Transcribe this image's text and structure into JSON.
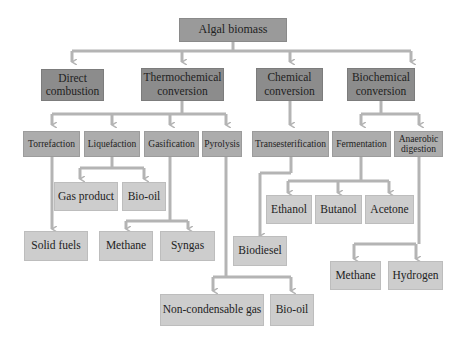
{
  "diagram": {
    "root": "Algal biomass",
    "level1": {
      "direct": "Direct combustion",
      "thermo": "Thermochemical conversion",
      "chemical": "Chemical conversion",
      "biochemical": "Biochemical conversion"
    },
    "level2": {
      "torrefaction": "Torrefaction",
      "liquefaction": "Liquefaction",
      "gasification": "Gasification",
      "pyrolysis": "Pyrolysis",
      "transesterification": "Transesterification",
      "fermentation": "Fermentation",
      "anaerobic": "Anaerobic digestion"
    },
    "products": {
      "gas_product": "Gas product",
      "liq_biooil": "Bio-oil",
      "solid_fuels": "Solid fuels",
      "gas_methane": "Methane",
      "syngas": "Syngas",
      "ethanol": "Ethanol",
      "butanol": "Butanol",
      "acetone": "Acetone",
      "biodiesel": "Biodiesel",
      "ad_methane": "Methane",
      "hydrogen": "Hydrogen",
      "noncondensable": "Non-condensable gas",
      "pyro_biooil": "Bio-oil"
    },
    "colors": {
      "connector": "#b4b4b4",
      "level1": "#9a9a9a",
      "level2": "#8c8c8c",
      "level3": "#acacac",
      "product": "#cdcdcd"
    }
  }
}
